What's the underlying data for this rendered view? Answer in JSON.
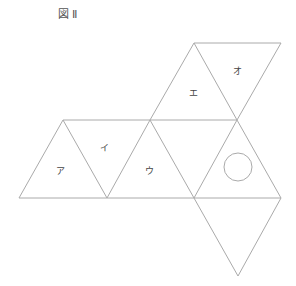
{
  "figure": {
    "title": "図Ⅱ",
    "stroke_color": "#aaaaaa",
    "labels": [
      {
        "text": "ア",
        "x": 60,
        "y": 170
      },
      {
        "text": "イ",
        "x": 104,
        "y": 147
      },
      {
        "text": "ウ",
        "x": 149,
        "y": 170
      },
      {
        "text": "エ",
        "x": 193,
        "y": 92
      },
      {
        "text": "オ",
        "x": 237,
        "y": 70
      }
    ],
    "circle": {
      "cx": 238,
      "cy": 167,
      "r": 14
    }
  }
}
